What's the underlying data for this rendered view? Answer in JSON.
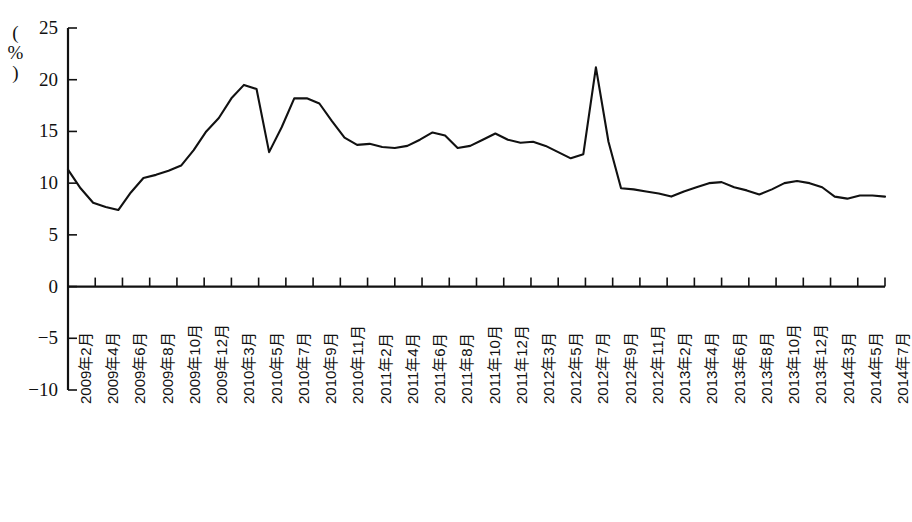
{
  "chart_data": {
    "type": "line",
    "title": "",
    "xlabel": "",
    "ylabel": "(%)",
    "ylim": [
      -10,
      25
    ],
    "ytick_labels": [
      "25",
      "20",
      "15",
      "10",
      "5",
      "0",
      "-5",
      "-10"
    ],
    "ytick_values": [
      25,
      20,
      15,
      10,
      5,
      0,
      -5,
      -10
    ],
    "grid": false,
    "legend": "none",
    "axis_note": "zero line drawn as horizontal axis with tick marks every 2 months",
    "x_tick_labels": [
      "2009年2月",
      "2009年4月",
      "2009年6月",
      "2009年8月",
      "2009年10月",
      "2009年12月",
      "2010年3月",
      "2010年5月",
      "2010年7月",
      "2010年9月",
      "2010年11月",
      "2011年2月",
      "2011年4月",
      "2011年6月",
      "2011年8月",
      "2011年10月",
      "2011年12月",
      "2012年3月",
      "2012年5月",
      "2012年7月",
      "2012年9月",
      "2012年11月",
      "2013年2月",
      "2013年4月",
      "2013年6月",
      "2013年8月",
      "2013年10月",
      "2013年12月",
      "2014年3月",
      "2014年5月",
      "2014年7月"
    ],
    "x": [
      "2009-02",
      "2009-03",
      "2009-04",
      "2009-05",
      "2009-06",
      "2009-07",
      "2009-08",
      "2009-09",
      "2009-10",
      "2009-11",
      "2009-12",
      "2010-01",
      "2010-02",
      "2010-03",
      "2010-04",
      "2010-05",
      "2010-06",
      "2010-07",
      "2010-08",
      "2010-09",
      "2010-10",
      "2010-11",
      "2010-12",
      "2011-01",
      "2011-02",
      "2011-03",
      "2011-04",
      "2011-05",
      "2011-06",
      "2011-07",
      "2011-08",
      "2011-09",
      "2011-10",
      "2011-11",
      "2011-12",
      "2012-01",
      "2012-02",
      "2012-03",
      "2012-04",
      "2012-05",
      "2012-06",
      "2012-07",
      "2012-08",
      "2012-09",
      "2012-10",
      "2012-11",
      "2012-12",
      "2013-01",
      "2013-02",
      "2013-03",
      "2013-04",
      "2013-05",
      "2013-06",
      "2013-07",
      "2013-08",
      "2013-09",
      "2013-10",
      "2013-11",
      "2013-12",
      "2014-01",
      "2014-02",
      "2014-03",
      "2014-04",
      "2014-05",
      "2014-06",
      "2014-07"
    ],
    "values": [
      11.3,
      9.5,
      8.1,
      7.7,
      7.4,
      9.1,
      10.5,
      10.8,
      11.2,
      11.7,
      13.2,
      15.0,
      16.3,
      18.2,
      19.5,
      19.1,
      13.0,
      15.4,
      18.2,
      18.2,
      17.7,
      16.0,
      14.4,
      13.7,
      13.8,
      13.5,
      13.4,
      13.6,
      14.2,
      14.9,
      14.6,
      13.4,
      13.6,
      14.2,
      14.8,
      14.2,
      13.9,
      14.0,
      13.6,
      13.0,
      12.4,
      12.8,
      21.2,
      14.0,
      9.5,
      9.4,
      9.2,
      9.0,
      8.7,
      9.2,
      9.6,
      10.0,
      10.1,
      9.6,
      9.3,
      8.9,
      9.4,
      10.0,
      10.2,
      10.0,
      9.6,
      8.7,
      8.5,
      8.8,
      8.8,
      8.7
    ],
    "line_color": "#111111",
    "background_color": "#ffffff"
  }
}
